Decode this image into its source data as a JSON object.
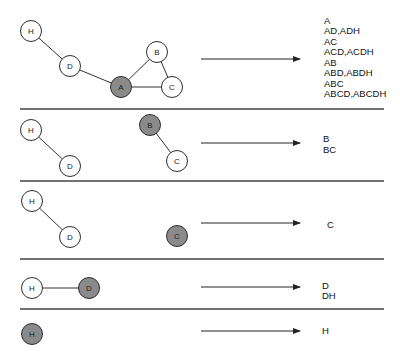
{
  "colors": {
    "node_default_fill": "#ffffff",
    "node_active_fill": "#8a8a8a",
    "stroke": "#2e2e2e",
    "divider": "#444444"
  },
  "node_radius": 10.5,
  "dividers": [
    {
      "x1": 20,
      "x2": 384,
      "y": 109
    },
    {
      "x1": 20,
      "x2": 384,
      "y": 181
    },
    {
      "x1": 20,
      "x2": 384,
      "y": 259
    },
    {
      "x1": 20,
      "x2": 384,
      "y": 309
    }
  ],
  "panels": [
    {
      "id": "panel-1",
      "start_node": "A",
      "nodes": [
        {
          "label": "H",
          "x": 31,
          "y": 31,
          "active": false
        },
        {
          "label": "D",
          "x": 70,
          "y": 66,
          "active": false
        },
        {
          "label": "A",
          "x": 121,
          "y": 87,
          "active": true
        },
        {
          "label": "B",
          "x": 157,
          "y": 52,
          "active": false
        },
        {
          "label": "C",
          "x": 172,
          "y": 87,
          "active": false
        }
      ],
      "edges": [
        [
          "H",
          "D"
        ],
        [
          "D",
          "A"
        ],
        [
          "A",
          "B"
        ],
        [
          "A",
          "C"
        ],
        [
          "B",
          "C"
        ]
      ],
      "arrow": {
        "x1": 201,
        "x2": 300,
        "y": 59
      },
      "results_x": 324,
      "results_y": 20,
      "results_spacing": 10.5,
      "results": [
        "A",
        "AD,ADH",
        "AC",
        "ACD,ACDH",
        "AB",
        "ABD,ABDH",
        "ABC",
        "ABCD,ABCDH"
      ]
    },
    {
      "id": "panel-2",
      "start_node": "B",
      "nodes": [
        {
          "label": "H",
          "x": 31,
          "y": 130,
          "active": false
        },
        {
          "label": "D",
          "x": 70,
          "y": 166,
          "active": false
        },
        {
          "label": "B",
          "x": 150,
          "y": 125,
          "active": true
        },
        {
          "label": "C",
          "x": 177,
          "y": 161,
          "active": false
        }
      ],
      "edges": [
        [
          "H",
          "D"
        ],
        [
          "B",
          "C"
        ]
      ],
      "arrow": {
        "x1": 201,
        "x2": 300,
        "y": 143
      },
      "results_x": 323,
      "results_y": 138,
      "results_spacing": 11,
      "results": [
        "B",
        "BC"
      ]
    },
    {
      "id": "panel-3",
      "start_node": "C",
      "nodes": [
        {
          "label": "H",
          "x": 32,
          "y": 201,
          "active": false
        },
        {
          "label": "D",
          "x": 70,
          "y": 237,
          "active": false
        },
        {
          "label": "C",
          "x": 177,
          "y": 236,
          "active": true
        }
      ],
      "edges": [
        [
          "H",
          "D"
        ]
      ],
      "arrow": {
        "x1": 201,
        "x2": 300,
        "y": 223
      },
      "results_x": 327,
      "results_y": 224,
      "results_spacing": 11,
      "results": [
        "C"
      ]
    },
    {
      "id": "panel-4",
      "start_node": "D",
      "nodes": [
        {
          "label": "H",
          "x": 32,
          "y": 288,
          "active": false
        },
        {
          "label": "D",
          "x": 89,
          "y": 288,
          "active": true
        }
      ],
      "edges": [
        [
          "H",
          "D"
        ]
      ],
      "arrow": {
        "x1": 201,
        "x2": 300,
        "y": 287
      },
      "results_x": 322,
      "results_y": 285,
      "results_spacing": 10.5,
      "results": [
        "D",
        "DH"
      ]
    },
    {
      "id": "panel-5",
      "start_node": "H",
      "nodes": [
        {
          "label": "H",
          "x": 32,
          "y": 334,
          "active": true
        }
      ],
      "edges": [],
      "arrow": {
        "x1": 201,
        "x2": 300,
        "y": 331
      },
      "results_x": 322,
      "results_y": 330,
      "results_spacing": 10.5,
      "results": [
        "H"
      ]
    }
  ]
}
